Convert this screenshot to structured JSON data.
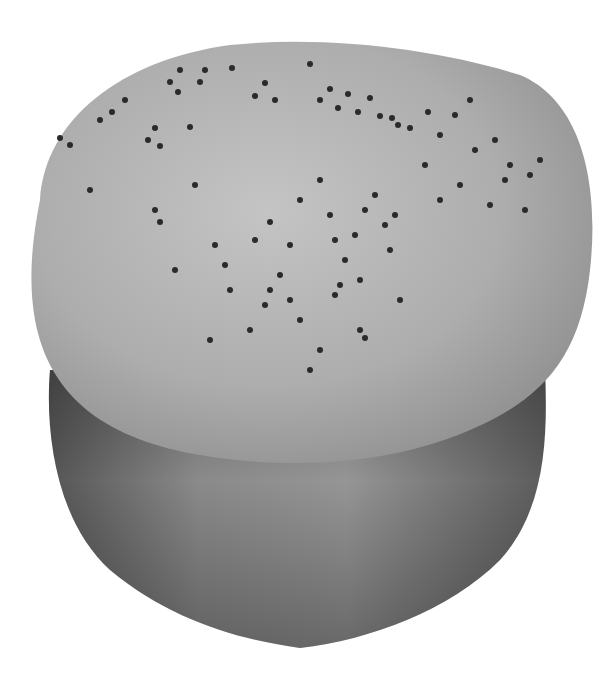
{
  "image": {
    "subject": "bread roll with poppy seeds",
    "description": "Grayscale photo of a round bread roll with a domed, poppy-seed-topped crown over a darker lower body, on a white background",
    "colors": {
      "background": "#ffffff",
      "crown_light": "#b8b8b8",
      "crown_mid": "#a6a6a6",
      "body_dark": "#6a6a6a",
      "body_mid": "#8a8a8a",
      "seed": "#2a2a2a"
    }
  }
}
